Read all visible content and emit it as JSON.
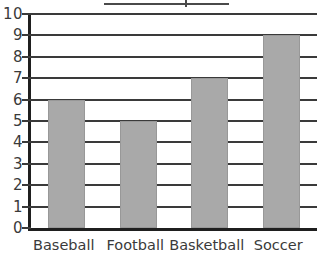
{
  "chart_data": {
    "type": "bar",
    "title": "",
    "xlabel": "",
    "ylabel": "",
    "categories": [
      "Baseball",
      "Football",
      "Basketball",
      "Soccer"
    ],
    "values": [
      6,
      5,
      7,
      9
    ],
    "ylim": [
      0,
      10
    ],
    "y_ticks": [
      0,
      1,
      2,
      3,
      4,
      5,
      6,
      7,
      8,
      9,
      10
    ],
    "y_tick_labels": [
      "0",
      "1",
      "2",
      "3",
      "4",
      "5",
      "6",
      "7",
      "8",
      "9",
      "10"
    ],
    "grid": true,
    "grid_axis": "y",
    "legend": false,
    "legend_position": "none",
    "bar_color": "#a9a9a9",
    "bar_edge_color": "#989898",
    "axis_color": "#1f1f1f",
    "gridline_color": "#3a3a3a",
    "background_color": "#ffffff",
    "annotations": []
  },
  "figure": {
    "top_rule_present": true
  }
}
